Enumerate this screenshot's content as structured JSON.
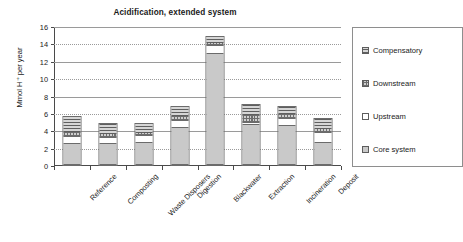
{
  "chart_data": {
    "type": "bar",
    "subtype": "stacked-bar",
    "title": "Acidification, extended system",
    "xlabel": "",
    "ylabel": "Mmol H+ per year",
    "ylabel_display": "Mmol H⁺ per year",
    "categories": [
      "Reference",
      "Composting",
      "Waste Disposers",
      "Digestion",
      "Blackwater",
      "Extraction",
      "Incineration",
      "Deposit"
    ],
    "series": [
      {
        "name": "Core system",
        "values": [
          2.5,
          2.5,
          2.6,
          4.4,
          13.0,
          4.7,
          4.6,
          2.7
        ]
      },
      {
        "name": "Upstream",
        "values": [
          0.8,
          0.8,
          0.9,
          0.8,
          0.9,
          0.3,
          0.9,
          1.1
        ]
      },
      {
        "name": "Downstream",
        "values": [
          0.6,
          0.4,
          0.4,
          0.6,
          0.4,
          0.9,
          0.6,
          0.5
        ]
      },
      {
        "name": "Compensatory",
        "values": [
          1.8,
          1.3,
          1.1,
          1.1,
          0.7,
          1.2,
          0.8,
          1.2
        ]
      }
    ],
    "totals": [
      5.7,
      5.0,
      5.0,
      6.9,
      15.0,
      7.1,
      6.9,
      5.5
    ],
    "ylim": [
      0,
      16
    ],
    "ytick_step": 2,
    "yticks": [
      "0",
      "2",
      "4",
      "6",
      "8",
      "10",
      "12",
      "14",
      "16"
    ],
    "grid": true,
    "grid_axis": "y",
    "legend_position": "right",
    "legend_order": [
      "Compensatory",
      "Downstream",
      "Upstream",
      "Core system"
    ],
    "colors": {
      "core_system": "#c9c9c9",
      "upstream": "#ffffff",
      "downstream": "#cfcfcf",
      "compensatory": "#d6d6d6",
      "axis": "#4a4a4a",
      "gridline": "#9a9a9a",
      "bar_outline": "#6b6b6b",
      "text": "#1a1a1a",
      "background": "#ffffff"
    }
  }
}
